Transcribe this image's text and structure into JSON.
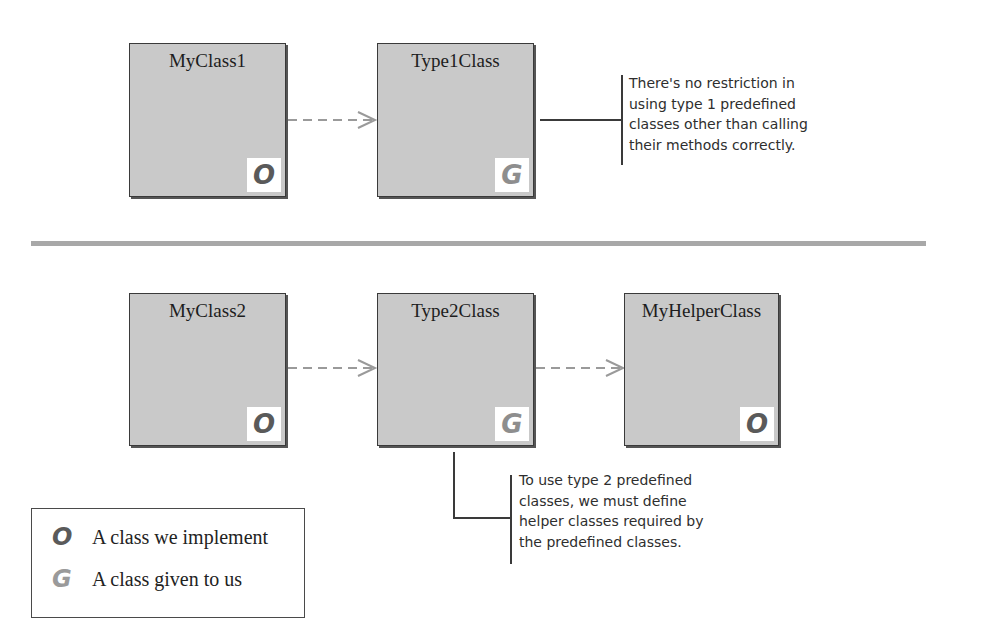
{
  "diagram": {
    "rows": [
      {
        "classes": [
          {
            "name": "MyClass1",
            "badge": "O",
            "kind": "ours"
          },
          {
            "name": "Type1Class",
            "badge": "G",
            "kind": "given"
          }
        ],
        "note": {
          "lines": [
            "There's no restriction in",
            "using type 1 predefined",
            "classes other than calling",
            "their methods correctly."
          ]
        }
      },
      {
        "classes": [
          {
            "name": "MyClass2",
            "badge": "O",
            "kind": "ours"
          },
          {
            "name": "Type2Class",
            "badge": "G",
            "kind": "given"
          },
          {
            "name": "MyHelperClass",
            "badge": "O",
            "kind": "ours"
          }
        ],
        "note": {
          "lines": [
            "To use type 2 predefined",
            "classes, we must define",
            "helper classes required by",
            "the predefined classes."
          ]
        }
      }
    ],
    "edges": [
      {
        "from": "MyClass1",
        "to": "Type1Class",
        "style": "dashed-open-arrow"
      },
      {
        "from": "MyClass2",
        "to": "Type2Class",
        "style": "dashed-open-arrow"
      },
      {
        "from": "Type2Class",
        "to": "MyHelperClass",
        "style": "dashed-open-arrow"
      }
    ],
    "legend": {
      "items": [
        {
          "symbol": "O",
          "label": "A class we implement"
        },
        {
          "symbol": "G",
          "label": "A class given to us"
        }
      ]
    },
    "colors": {
      "box_fill": "#c9c9c9",
      "box_border": "#3a3a3a",
      "arrow": "#9a9a9a",
      "separator": "#a8a8a8",
      "ours_symbol": "#5a5a5a",
      "given_symbol": "#8e8e8e"
    }
  }
}
